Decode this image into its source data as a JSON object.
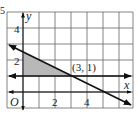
{
  "problem_number": "5",
  "graph": {
    "grid": {
      "x_min": -1,
      "x_max": 7,
      "y_min": -1,
      "y_max": 5
    },
    "axis_labels": {
      "x": "x",
      "y": "y",
      "origin": "O"
    },
    "tick_labels": {
      "x": [
        "2",
        "4"
      ],
      "y": [
        "2",
        "4"
      ]
    },
    "point_label": "(3, 1)",
    "lines": [
      {
        "name": "horizontal",
        "equation": "y = 1"
      },
      {
        "name": "decreasing",
        "equation": "y = -x/2 + 5/2"
      }
    ],
    "shaded_region": {
      "vertices": [
        [
          0,
          1
        ],
        [
          0,
          2.5
        ],
        [
          3,
          1
        ]
      ],
      "color": "#b8b8b8"
    },
    "colors": {
      "grid": "#555555",
      "lines": "#111111"
    }
  }
}
